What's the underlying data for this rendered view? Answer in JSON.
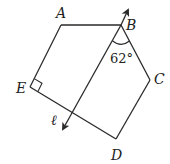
{
  "diagram": {
    "type": "geometry-figure",
    "stroke_color": "#2a2a2a",
    "background": "#ffffff",
    "shape": "pentagon ABCDE",
    "vertices": {
      "A": {
        "label": "A",
        "x": 61,
        "y": 25
      },
      "B": {
        "label": "B",
        "x": 121,
        "y": 25
      },
      "C": {
        "label": "C",
        "x": 150,
        "y": 80
      },
      "D": {
        "label": "D",
        "x": 116,
        "y": 139
      },
      "E": {
        "label": "E",
        "x": 30,
        "y": 87
      }
    },
    "line": {
      "label": "ℓ",
      "description": "line through B, crossing ED, with arrows at both ends",
      "start": {
        "x": 128,
        "y": 9
      },
      "end": {
        "x": 62,
        "y": 130
      }
    },
    "angle": {
      "vertex": "B",
      "value_label": "62°",
      "description": "angle between line ℓ and segment BC"
    },
    "right_angle": {
      "vertex": "E",
      "description": "right angle at E between EA and ED"
    }
  }
}
